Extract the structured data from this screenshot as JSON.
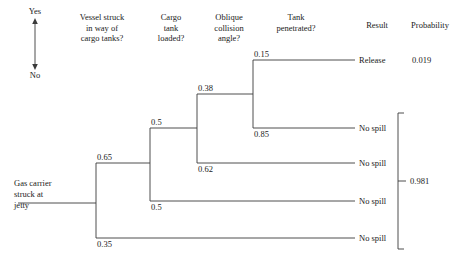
{
  "figure": {
    "type": "event-tree",
    "legend": {
      "top": "Yes",
      "bottom": "No"
    },
    "initiating_event": "Gas carrier\nstruck at\njetty",
    "headers": [
      {
        "id": "vessel-struck",
        "label": "Vessel struck\nin way of\ncargo tanks?"
      },
      {
        "id": "cargo-tank-loaded",
        "label": "Cargo\ntank\nloaded?"
      },
      {
        "id": "oblique-collision-angle",
        "label": "Oblique\ncollision\nangle?"
      },
      {
        "id": "tank-penetrated",
        "label": "Tank\npenetrated?"
      },
      {
        "id": "result",
        "label": "Result"
      },
      {
        "id": "probability",
        "label": "Probability"
      }
    ],
    "branch_probabilities": [
      {
        "id": "p-vessel-yes",
        "value": "0.65"
      },
      {
        "id": "p-vessel-no",
        "value": "0.35"
      },
      {
        "id": "p-loaded-yes",
        "value": "0.5"
      },
      {
        "id": "p-loaded-no",
        "value": "0.5"
      },
      {
        "id": "p-oblique-yes",
        "value": "0.38"
      },
      {
        "id": "p-oblique-no",
        "value": "0.62"
      },
      {
        "id": "p-penetrated-yes",
        "value": "0.15"
      },
      {
        "id": "p-penetrated-no",
        "value": "0.85"
      }
    ],
    "outcomes": [
      {
        "id": "outcome-1",
        "result": "Release",
        "probability": "0.019"
      },
      {
        "id": "outcome-2",
        "result": "No spill",
        "probability": ""
      },
      {
        "id": "outcome-3",
        "result": "No spill",
        "probability": ""
      },
      {
        "id": "outcome-4",
        "result": "No spill",
        "probability": ""
      },
      {
        "id": "outcome-5",
        "result": "No spill",
        "probability": ""
      }
    ],
    "grouped_probability": "0.981",
    "colors": {
      "line": "#3a3a3a",
      "text": "#1a1a1a",
      "background": "#ffffff"
    }
  }
}
